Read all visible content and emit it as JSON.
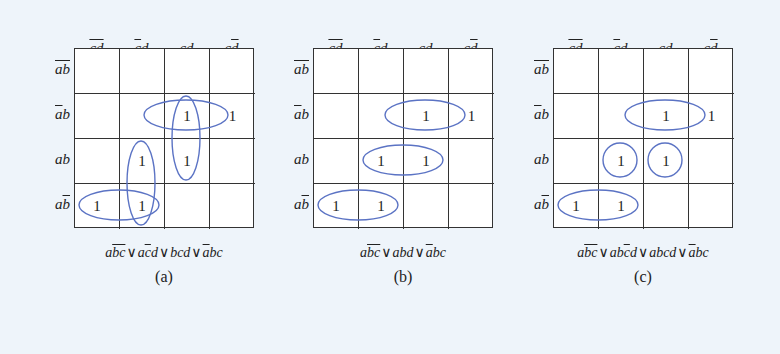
{
  "column_labels": [
    {
      "text": "cd",
      "overline": "both"
    },
    {
      "text": "cd",
      "overline": "c"
    },
    {
      "text": "cd",
      "overline": "none"
    },
    {
      "text": "cd",
      "overline": "d"
    }
  ],
  "row_labels": [
    {
      "text": "ab",
      "overline": "both"
    },
    {
      "text": "ab",
      "overline": "a"
    },
    {
      "text": "ab",
      "overline": "none"
    },
    {
      "text": "ab",
      "overline": "b"
    }
  ],
  "ellipse_color": "#5b73c4",
  "maps": [
    {
      "id": "a",
      "left": 40,
      "cells": [
        [
          "",
          "",
          "",
          ""
        ],
        [
          "",
          "",
          "1",
          "1"
        ],
        [
          "",
          "1",
          "1",
          ""
        ],
        [
          "1",
          "1",
          "",
          ""
        ]
      ],
      "groups": [
        {
          "cx": 112,
          "cy": 67,
          "rx": 42,
          "ry": 15
        },
        {
          "cx": 112,
          "cy": 90,
          "rx": 14,
          "ry": 42
        },
        {
          "cx": 67,
          "cy": 135,
          "rx": 14,
          "ry": 42
        },
        {
          "cx": 45,
          "cy": 157,
          "rx": 40,
          "ry": 15
        }
      ],
      "expression": "a̅b̅c̅ ∨ ac̅d ∨ bcd ∨ a̅bc",
      "caption": "(a)"
    },
    {
      "id": "b",
      "left": 279,
      "cells": [
        [
          "",
          "",
          "",
          ""
        ],
        [
          "",
          "",
          "1",
          "1"
        ],
        [
          "",
          "1",
          "1",
          ""
        ],
        [
          "1",
          "1",
          "",
          ""
        ]
      ],
      "groups": [
        {
          "cx": 112,
          "cy": 67,
          "rx": 40,
          "ry": 15
        },
        {
          "cx": 90,
          "cy": 112,
          "rx": 40,
          "ry": 15
        },
        {
          "cx": 45,
          "cy": 157,
          "rx": 40,
          "ry": 15
        }
      ],
      "expression": "abc ∨ abd ∨ abc",
      "caption": "(b)"
    },
    {
      "id": "c",
      "left": 519,
      "cells": [
        [
          "",
          "",
          "",
          ""
        ],
        [
          "",
          "",
          "1",
          "1"
        ],
        [
          "",
          "1",
          "1",
          ""
        ],
        [
          "1",
          "1",
          "",
          ""
        ]
      ],
      "groups": [
        {
          "cx": 112,
          "cy": 67,
          "rx": 40,
          "ry": 15
        },
        {
          "cx": 67,
          "cy": 112,
          "rx": 17,
          "ry": 17
        },
        {
          "cx": 112,
          "cy": 112,
          "rx": 17,
          "ry": 17
        },
        {
          "cx": 45,
          "cy": 157,
          "rx": 40,
          "ry": 15
        }
      ],
      "expression": "abc ∨ abcd ∨ abcd ∨ abc",
      "caption": "(c)"
    }
  ],
  "expressions": {
    "a": [
      {
        "t": "a"
      },
      {
        "t": "bc",
        "ov": true
      },
      {
        "op": "∨"
      },
      {
        "t": "a"
      },
      {
        "t": "c",
        "ov": true
      },
      {
        "t": "d"
      },
      {
        "op": "∨"
      },
      {
        "t": "bcd"
      },
      {
        "op": "∨"
      },
      {
        "t": "a",
        "ov": true
      },
      {
        "t": "bc"
      }
    ],
    "b": [
      {
        "t": "a"
      },
      {
        "t": "bc",
        "ov": true
      },
      {
        "op": "∨"
      },
      {
        "t": "abd"
      },
      {
        "op": "∨"
      },
      {
        "t": "a",
        "ov": true
      },
      {
        "t": "bc"
      }
    ],
    "c": [
      {
        "t": "a"
      },
      {
        "t": "bc",
        "ov": true
      },
      {
        "op": "∨"
      },
      {
        "t": "ab"
      },
      {
        "t": "c",
        "ov": true
      },
      {
        "t": "d"
      },
      {
        "op": "∨"
      },
      {
        "t": "abcd"
      },
      {
        "op": "∨"
      },
      {
        "t": "a",
        "ov": true
      },
      {
        "t": "bc"
      }
    ]
  }
}
